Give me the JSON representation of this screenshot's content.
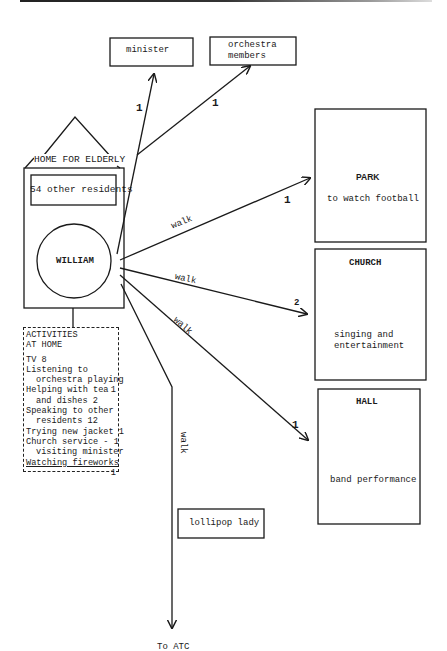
{
  "home": {
    "title": "HOME FOR ELDERLY",
    "residents_box": "54 other residents",
    "person": "WILLIAM"
  },
  "top_boxes": [
    {
      "label": "minister",
      "count": "1"
    },
    {
      "label_line1": "orchestra",
      "label_line2": "members",
      "count": "1"
    }
  ],
  "places": [
    {
      "name": "PARK",
      "description": "to watch football",
      "edge_label": "walk",
      "count": "1"
    },
    {
      "name": "CHURCH",
      "description_line1": "singing and",
      "description_line2": "entertainment",
      "edge_label": "walk",
      "count": "2"
    },
    {
      "name": "HALL",
      "description": "band performance",
      "edge_label": "walk",
      "count": "1"
    }
  ],
  "down_path": {
    "edge_label": "walk",
    "box_label": "lollipop lady",
    "destination": "To ATC"
  },
  "activities": {
    "title_line1": "ACTIVITIES",
    "title_line2": "AT HOME",
    "items": [
      {
        "text": "TV 8"
      },
      {
        "text": "Listening to"
      },
      {
        "text": "orchestra playing"
      },
      {
        "text": "Helping with tea",
        "count": "1"
      },
      {
        "text": "and dishes 2"
      },
      {
        "text": "Speaking to other"
      },
      {
        "text": "residents 12"
      },
      {
        "text": "Trying new jacket 1"
      },
      {
        "text": "Church service - 1"
      },
      {
        "text": "visiting minister"
      },
      {
        "text": "Watching fireworks",
        "count": "1"
      }
    ]
  }
}
